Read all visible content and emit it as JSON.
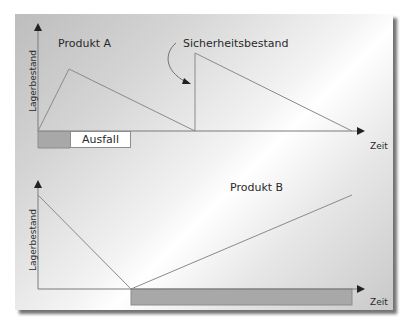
{
  "diagram": {
    "top_chart": {
      "title": "Produkt A",
      "y_axis_label": "Lagerbestand",
      "x_axis_label": "Zeit",
      "annotation": "Sicherheitsbestand",
      "outage_label": "Ausfall"
    },
    "bottom_chart": {
      "title": "Produkt B",
      "y_axis_label": "Lagerbestand",
      "x_axis_label": "Zeit"
    },
    "colors": {
      "line": "#8a8a8a",
      "outage_fill": "#a6a6a6",
      "text": "#2a2a2a"
    }
  }
}
